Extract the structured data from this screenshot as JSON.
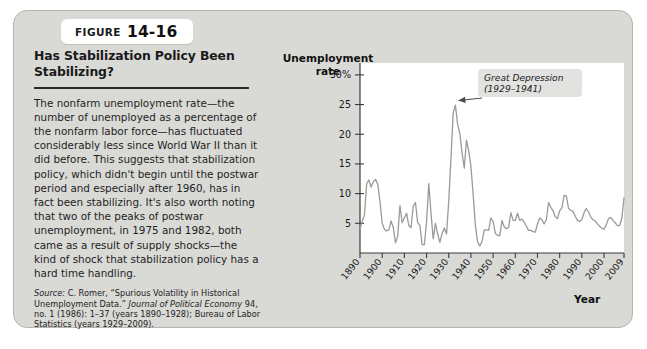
{
  "figure": {
    "badge_word": "FIGURE",
    "badge_number": "14-16",
    "title": "Has Stabilization Policy Been Stabilizing?",
    "body": "The nonfarm unemployment rate—the number of unemployed as a percentage of the nonfarm labor force—has fluctuated considerably less since World War II than it did before. This suggests that stabilization policy, which didn't begin until the postwar period and especially after 1960, has in fact been stabilizing. It's also worth noting that two of the peaks of postwar unemployment, in 1975 and 1982, both came as a result of supply shocks—the kind of shock that stabilization policy has a hard time handling.",
    "source_label": "Source:",
    "source_text_1": " C. Romer, “Spurious Volatility in Historical Unemployment Data.” ",
    "source_journal": "Journal of Political Economy",
    "source_text_2": " 94, no. 1 (1986): 1–37 (years 1890–1928); Bureau of Labor Statistics (years 1929–2009)."
  },
  "chart_data": {
    "type": "line",
    "title": "",
    "ylabel": "Unemployment rate",
    "xlabel": "Year",
    "ylim": [
      0,
      32
    ],
    "xlim": [
      1890,
      2009
    ],
    "grid": false,
    "legend": null,
    "line_color": "#9a9a98",
    "ytick_labels": [
      "30%",
      "25",
      "20",
      "15",
      "10",
      "5"
    ],
    "ytick_values": [
      30,
      25,
      20,
      15,
      10,
      5
    ],
    "xtick_labels": [
      "1890",
      "1900",
      "1910",
      "1920",
      "1930",
      "1940",
      "1950",
      "1960",
      "1970",
      "1980",
      "1990",
      "2000",
      "2009"
    ],
    "xtick_values": [
      1890,
      1900,
      1910,
      1920,
      1930,
      1940,
      1950,
      1960,
      1970,
      1980,
      1990,
      2000,
      2009
    ],
    "annotations": [
      {
        "text_line_1": "Great Depression",
        "text_line_2": "(1929–1941)",
        "points_to_year": 1933,
        "points_to_value": 25.0
      }
    ],
    "x": [
      1890,
      1891,
      1892,
      1893,
      1894,
      1895,
      1896,
      1897,
      1898,
      1899,
      1900,
      1901,
      1902,
      1903,
      1904,
      1905,
      1906,
      1907,
      1908,
      1909,
      1910,
      1911,
      1912,
      1913,
      1914,
      1915,
      1916,
      1917,
      1918,
      1919,
      1920,
      1921,
      1922,
      1923,
      1924,
      1925,
      1926,
      1927,
      1928,
      1929,
      1930,
      1931,
      1932,
      1933,
      1934,
      1935,
      1936,
      1937,
      1938,
      1939,
      1940,
      1941,
      1942,
      1943,
      1944,
      1945,
      1946,
      1947,
      1948,
      1949,
      1950,
      1951,
      1952,
      1953,
      1954,
      1955,
      1956,
      1957,
      1958,
      1959,
      1960,
      1961,
      1962,
      1963,
      1964,
      1965,
      1966,
      1967,
      1968,
      1969,
      1970,
      1971,
      1972,
      1973,
      1974,
      1975,
      1976,
      1977,
      1978,
      1979,
      1980,
      1981,
      1982,
      1983,
      1984,
      1985,
      1986,
      1987,
      1988,
      1989,
      1990,
      1991,
      1992,
      1993,
      1994,
      1995,
      1996,
      1997,
      1998,
      1999,
      2000,
      2001,
      2002,
      2003,
      2004,
      2005,
      2006,
      2007,
      2008,
      2009
    ],
    "values": [
      4.0,
      5.4,
      6.4,
      11.7,
      12.3,
      11.1,
      12.0,
      12.4,
      11.6,
      8.7,
      5.0,
      4.0,
      3.7,
      3.9,
      5.4,
      4.3,
      1.7,
      2.8,
      8.0,
      5.1,
      5.9,
      6.7,
      4.6,
      4.3,
      7.9,
      8.5,
      5.1,
      4.6,
      1.4,
      1.4,
      5.2,
      11.7,
      6.7,
      2.4,
      5.0,
      3.2,
      1.8,
      3.3,
      4.2,
      3.2,
      8.7,
      15.9,
      23.6,
      24.9,
      21.7,
      20.1,
      16.9,
      14.3,
      19.0,
      17.2,
      14.6,
      9.9,
      4.7,
      1.9,
      1.2,
      1.9,
      3.9,
      3.9,
      3.8,
      5.9,
      5.3,
      3.3,
      3.0,
      2.9,
      5.5,
      4.4,
      4.1,
      4.3,
      6.8,
      5.5,
      5.5,
      6.7,
      5.5,
      5.7,
      5.2,
      4.5,
      3.8,
      3.8,
      3.6,
      3.5,
      4.9,
      5.9,
      5.6,
      4.9,
      5.6,
      8.5,
      7.7,
      7.1,
      6.1,
      5.8,
      7.1,
      7.6,
      9.7,
      9.6,
      7.5,
      7.2,
      7.0,
      6.2,
      5.5,
      5.3,
      5.6,
      6.8,
      7.5,
      6.9,
      6.1,
      5.6,
      5.4,
      4.9,
      4.5,
      4.2,
      4.0,
      4.7,
      5.8,
      6.0,
      5.5,
      5.1,
      4.6,
      4.6,
      5.8,
      9.3
    ]
  }
}
